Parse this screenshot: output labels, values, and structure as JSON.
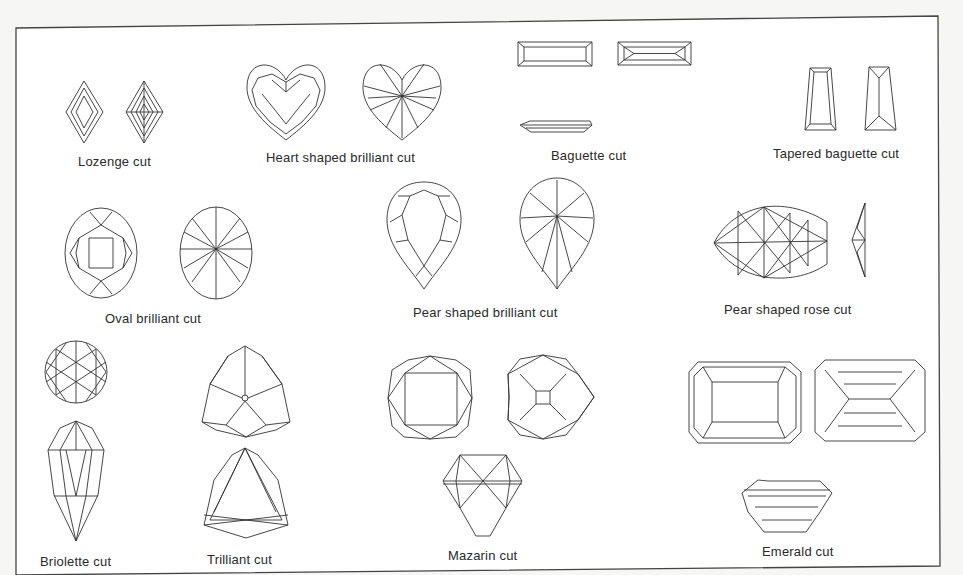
{
  "figure": {
    "background": "#ffffff",
    "line_color": "#333333",
    "cuts": [
      {
        "id": "lozenge",
        "label": "Lozenge cut",
        "views": 2
      },
      {
        "id": "heart",
        "label": "Heart shaped brilliant cut",
        "views": 2
      },
      {
        "id": "baguette",
        "label": "Baguette cut",
        "views": 3
      },
      {
        "id": "tapered-baguette",
        "label": "Tapered baguette cut",
        "views": 2
      },
      {
        "id": "oval",
        "label": "Oval brilliant cut",
        "views": 2
      },
      {
        "id": "pear-brilliant",
        "label": "Pear shaped brilliant cut",
        "views": 2
      },
      {
        "id": "pear-rose",
        "label": "Pear shaped rose cut",
        "views": 2
      },
      {
        "id": "briolette",
        "label": "Briolette cut",
        "views": 2
      },
      {
        "id": "trilliant",
        "label": "Trilliant cut",
        "views": 2
      },
      {
        "id": "mazarin",
        "label": "Mazarin cut",
        "views": 3
      },
      {
        "id": "emerald",
        "label": "Emerald cut",
        "views": 3
      }
    ]
  }
}
